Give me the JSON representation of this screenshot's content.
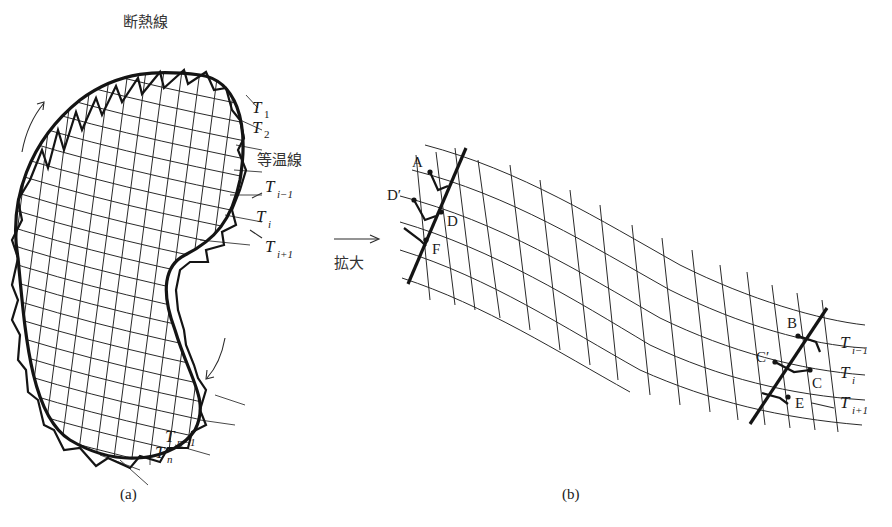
{
  "figure": {
    "panel_a": {
      "caption": "(a)",
      "adiabat_label": "断熱線",
      "isotherm_label": "等温線",
      "temperature_labels": [
        {
          "base": "T",
          "sub": "1"
        },
        {
          "base": "T",
          "sub": "2"
        },
        {
          "base": "T",
          "sub": "i−1"
        },
        {
          "base": "T",
          "sub": "i"
        },
        {
          "base": "T",
          "sub": "i+1"
        },
        {
          "base": "T",
          "sub": "n−1"
        },
        {
          "base": "T",
          "sub": "n"
        }
      ],
      "direction": "clockwise"
    },
    "magnify_label": "拡大",
    "panel_b": {
      "caption": "(b)",
      "points_left": [
        "A",
        "D′",
        "D",
        "F"
      ],
      "points_right": [
        "B",
        "C′",
        "C",
        "E"
      ],
      "temperature_labels": [
        {
          "base": "T",
          "sub": "i−1"
        },
        {
          "base": "T",
          "sub": "i"
        },
        {
          "base": "T",
          "sub": "i+1"
        }
      ]
    }
  }
}
